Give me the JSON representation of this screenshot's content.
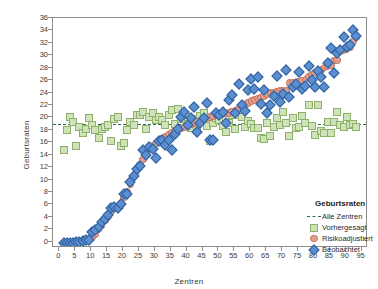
{
  "chart_data": {
    "type": "scatter",
    "title": "",
    "xlabel": "Zentren",
    "ylabel": "Geburtsraten",
    "xlim": [
      -2,
      97
    ],
    "ylim": [
      -1,
      36
    ],
    "xticks": [
      0,
      5,
      10,
      15,
      20,
      25,
      30,
      35,
      40,
      45,
      50,
      55,
      60,
      65,
      70,
      75,
      80,
      85,
      90,
      95
    ],
    "yticks": [
      0,
      2,
      4,
      6,
      8,
      10,
      12,
      14,
      16,
      18,
      20,
      22,
      24,
      26,
      28,
      30,
      32,
      34,
      36
    ],
    "grid": false,
    "legend_position": "inside-bottom-right",
    "reference_line": {
      "label": "Alle Zentren",
      "y": 19.0,
      "style": "dashed",
      "color": "#2f6b4f"
    },
    "series": [
      {
        "name": "Vorhergesagt",
        "marker": "square",
        "color": "#cfe3b8",
        "edge_color": "#8fb06a",
        "x": [
          1,
          2,
          3,
          4,
          5,
          6,
          7,
          8,
          9,
          10,
          11,
          12,
          13,
          14,
          15,
          16,
          17,
          18,
          19,
          20,
          21,
          22,
          23,
          24,
          25,
          26,
          27,
          28,
          29,
          30,
          31,
          32,
          33,
          34,
          35,
          36,
          37,
          38,
          39,
          40,
          41,
          42,
          43,
          44,
          45,
          46,
          47,
          48,
          49,
          50,
          51,
          52,
          53,
          54,
          55,
          56,
          57,
          58,
          59,
          60,
          61,
          62,
          63,
          64,
          65,
          66,
          67,
          68,
          69,
          70,
          71,
          72,
          73,
          74,
          75,
          76,
          77,
          78,
          79,
          80,
          81,
          82,
          83,
          84,
          85,
          86,
          87,
          88,
          89,
          90,
          91,
          92,
          93
        ],
        "y": [
          14.9,
          18.2,
          20.2,
          19.5,
          15.5,
          18.7,
          17.7,
          18.3,
          20.1,
          19.0,
          18.2,
          16.9,
          18.3,
          18.6,
          19.0,
          16.4,
          19.9,
          20.2,
          15.5,
          16.1,
          18.2,
          19.4,
          19.0,
          20.5,
          20.6,
          21.1,
          18.3,
          20.2,
          20.8,
          19.7,
          20.3,
          19.8,
          18.9,
          20.5,
          21.4,
          19.1,
          21.5,
          19.9,
          20.7,
          20.3,
          18.4,
          19.9,
          18.6,
          20.4,
          20.9,
          18.8,
          16.3,
          19.3,
          20.0,
          19.8,
          18.8,
          17.9,
          19.2,
          20.5,
          18.3,
          20.6,
          20.2,
          18.7,
          19.6,
          19.1,
          18.5,
          18.4,
          16.8,
          16.7,
          19.3,
          17.1,
          18.7,
          20.1,
          18.9,
          21.0,
          19.2,
          17.1,
          20.1,
          18.5,
          18.6,
          20.4,
          19.3,
          22.2,
          18.8,
          17.4,
          22.1,
          18.0,
          17.6,
          19.5,
          17.6,
          19.4,
          21.1,
          19.0,
          18.7,
          20.3,
          18.9,
          19.1,
          18.6
        ]
      },
      {
        "name": "Risikoadjustiert",
        "marker": "circle",
        "color": "#e4a08e",
        "edge_color": "#c46a52",
        "x": [
          1,
          2,
          3,
          4,
          5,
          6,
          7,
          8,
          9,
          10,
          11,
          12,
          13,
          14,
          15,
          16,
          17,
          18,
          19,
          20,
          21,
          22,
          23,
          24,
          25,
          26,
          27,
          28,
          29,
          30,
          31,
          32,
          33,
          34,
          35,
          36,
          37,
          38,
          39,
          40,
          41,
          42,
          43,
          44,
          45,
          46,
          47,
          48,
          49,
          50,
          51,
          52,
          53,
          54,
          55,
          56,
          57,
          58,
          59,
          60,
          61,
          62,
          63,
          64,
          65,
          66,
          67,
          68,
          69,
          70,
          71,
          72,
          73,
          74,
          75,
          76,
          77,
          78,
          79,
          80,
          81,
          82,
          83,
          84,
          85,
          86,
          87,
          88,
          89,
          90,
          91,
          92,
          93
        ],
        "y": [
          0.0,
          0.0,
          0.0,
          0.0,
          0.1,
          0.2,
          0.3,
          0.4,
          0.5,
          0.9,
          1.4,
          2.2,
          2.9,
          3.6,
          4.2,
          5.0,
          5.5,
          5.8,
          6.2,
          7.3,
          8.2,
          9.4,
          10.6,
          11.5,
          12.6,
          13.4,
          14.3,
          15.0,
          15.6,
          16.0,
          16.4,
          16.7,
          17.1,
          17.4,
          17.7,
          18.0,
          18.2,
          18.4,
          18.6,
          18.8,
          19.0,
          19.2,
          19.4,
          19.6,
          19.8,
          20.0,
          20.2,
          20.4,
          20.5,
          20.6,
          20.7,
          20.8,
          20.9,
          21.1,
          21.3,
          21.6,
          21.9,
          22.2,
          22.5,
          22.8,
          23.0,
          23.2,
          23.4,
          23.6,
          23.9,
          24.1,
          24.2,
          24.3,
          24.4,
          24.4,
          24.5,
          25.7,
          25.8,
          25.8,
          25.9,
          26.0,
          26.3,
          26.7,
          27.1,
          27.4,
          27.6,
          27.8,
          28.2,
          28.4,
          28.5,
          29.3,
          29.4,
          30.8,
          31.0,
          31.2,
          31.5,
          32.4,
          33.1
        ]
      },
      {
        "name": "Beobachtet",
        "marker": "diamond",
        "color": "#5b8fd0",
        "edge_color": "#2e5e9e",
        "x": [
          1,
          2,
          3,
          4,
          5,
          6,
          7,
          8,
          9,
          10,
          11,
          12,
          13,
          14,
          15,
          16,
          17,
          18,
          19,
          20,
          21,
          22,
          23,
          24,
          25,
          26,
          27,
          28,
          29,
          30,
          31,
          32,
          33,
          34,
          35,
          36,
          37,
          38,
          39,
          40,
          41,
          42,
          43,
          44,
          45,
          46,
          47,
          48,
          49,
          50,
          51,
          52,
          53,
          54,
          55,
          56,
          57,
          58,
          59,
          60,
          61,
          62,
          63,
          64,
          65,
          66,
          67,
          68,
          69,
          70,
          71,
          72,
          73,
          74,
          75,
          76,
          77,
          78,
          79,
          80,
          81,
          82,
          83,
          84,
          85,
          86,
          87,
          88,
          89,
          90,
          91,
          92,
          93
        ],
        "y": [
          0.0,
          0.0,
          0.0,
          0.0,
          0.1,
          0.2,
          0.3,
          0.4,
          0.5,
          1.8,
          2.0,
          2.6,
          3.4,
          3.9,
          4.4,
          5.6,
          5.7,
          5.6,
          6.3,
          7.8,
          7.9,
          9.7,
          10.8,
          11.8,
          12.4,
          14.9,
          14.2,
          15.4,
          15.1,
          13.7,
          16.4,
          16.6,
          15.8,
          16.6,
          14.9,
          17.5,
          18.3,
          20.3,
          21.0,
          18.9,
          20.0,
          21.9,
          17.8,
          19.3,
          20.1,
          22.5,
          16.5,
          16.6,
          20.9,
          20.6,
          21.0,
          19.3,
          22.9,
          23.7,
          20.8,
          25.6,
          22.1,
          21.2,
          24.6,
          26.4,
          24.8,
          26.6,
          22.3,
          24.5,
          20.8,
          22.2,
          23.6,
          26.9,
          22.6,
          24.0,
          27.8,
          23.4,
          25.0,
          25.5,
          27.5,
          24.8,
          25.2,
          28.4,
          26.2,
          25.1,
          27.7,
          26.6,
          25.0,
          29.0,
          31.3,
          27.3,
          30.5,
          31.0,
          33.1,
          31.5,
          31.8,
          34.3,
          33.2
        ]
      }
    ],
    "legend": {
      "title": "Geburtsraten",
      "entries": [
        {
          "label": "Alle Zentren",
          "marker": "dashed-line"
        },
        {
          "label": "Vorhergesagt",
          "marker": "square"
        },
        {
          "label": "Risikoadjustiert",
          "marker": "circle"
        },
        {
          "label": "Beobachtet",
          "marker": "diamond"
        }
      ]
    }
  }
}
